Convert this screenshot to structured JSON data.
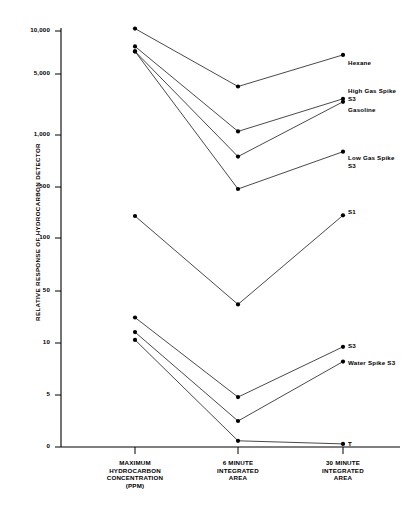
{
  "chart_data": {
    "type": "line",
    "title": "",
    "xlabel": "",
    "ylabel": "RELATIVE RESPONSE OF HYDROCARBON DETECTOR",
    "categories": [
      "MAXIMUM\nHYDROCARBON\nCONCENTRATION\n(PPM)",
      "6 MINUTE\nINTEGRATED\nAREA",
      "30 MINUTE\nINTEGRATED\nAREA"
    ],
    "yticks": [
      {
        "label": "10,000",
        "value": 10000
      },
      {
        "label": "5,000",
        "value": 5000
      },
      {
        "label": "1,000",
        "value": 1000
      },
      {
        "label": "500",
        "value": 500
      },
      {
        "label": "100",
        "value": 100
      },
      {
        "label": "50",
        "value": 50
      },
      {
        "label": "10",
        "value": 10
      },
      {
        "label": "5",
        "value": 5
      },
      {
        "label": "0",
        "value": 0
      }
    ],
    "yscale": "log-segmented",
    "grid": false,
    "legend_position": "right-inline",
    "series": [
      {
        "name": "Hexane",
        "label": "Hexane",
        "values": [
          10400,
          3600,
          6800
        ]
      },
      {
        "name": "High Gas Spike S3",
        "label": "High Gas Spike\nS3",
        "values": [
          7800,
          1100,
          2600
        ]
      },
      {
        "name": "Gasoline",
        "label": "Gasoline",
        "values": [
          7200,
          750,
          2400
        ]
      },
      {
        "name": "Low Gas Spike S3",
        "label": "Low Gas Spike\nS3",
        "values": [
          7200,
          470,
          800
        ]
      },
      {
        "name": "S1",
        "label": "S1",
        "values": [
          200,
          33,
          205
        ]
      },
      {
        "name": "S3",
        "label": "S3",
        "values": [
          22,
          4.8,
          9.5
        ]
      },
      {
        "name": "Water Spike S3",
        "label": "Water Spike S3",
        "values": [
          14,
          2.5,
          7.8
        ]
      },
      {
        "name": "T",
        "label": "T",
        "values": [
          11,
          0.6,
          0.3
        ]
      }
    ],
    "colors": {
      "line": "#1a1a1a",
      "marker": "#000000",
      "axis": "#000000",
      "background": "#ffffff"
    }
  }
}
